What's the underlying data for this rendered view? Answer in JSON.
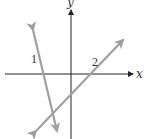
{
  "diagram": {
    "type": "coordinate-plane-with-lines",
    "axes": {
      "x_label": "x",
      "y_label": "y",
      "color": "#222222",
      "origin": [
        71,
        74
      ],
      "x_axis": {
        "x1": 5,
        "x2": 133,
        "y": 74
      },
      "y_axis": {
        "x": 71,
        "y1": 139,
        "y2": 10
      }
    },
    "lines": [
      {
        "label": "1",
        "slope": "negative (steep)",
        "color": "#a0a0a0",
        "start": [
          33,
          30
        ],
        "end": [
          57,
          131
        ],
        "label_pos": [
          34,
          60
        ]
      },
      {
        "label": "2",
        "slope": "positive",
        "color": "#a0a0a0",
        "start": [
          36,
          131
        ],
        "end": [
          123,
          40
        ],
        "label_pos": [
          94,
          64
        ]
      }
    ]
  }
}
